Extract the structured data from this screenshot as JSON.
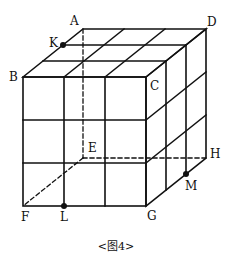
{
  "figure": {
    "caption": "<图4>",
    "vertices": {
      "A": "A",
      "B": "B",
      "C": "C",
      "D": "D",
      "E": "E",
      "F": "F",
      "G": "G",
      "H": "H"
    },
    "points": {
      "K": "K",
      "L": "L",
      "M": "M"
    },
    "grid_divisions": 3,
    "hidden_edges": [
      "AE",
      "EF",
      "EH"
    ],
    "colors": {
      "line": "#111111",
      "background": "#ffffff"
    }
  }
}
